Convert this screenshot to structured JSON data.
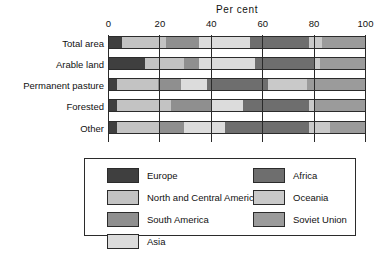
{
  "chart_data": {
    "type": "bar",
    "orientation": "horizontal",
    "stacked": true,
    "title": "Per cent",
    "xlabel": "",
    "ylabel": "",
    "xlim": [
      0,
      100
    ],
    "xticks": [
      0,
      20,
      40,
      60,
      80,
      100
    ],
    "xtick_labels": [
      "0",
      "20",
      "40",
      "60",
      "80",
      "100"
    ],
    "grid": true,
    "legend_position": "bottom",
    "categories": [
      "Total area",
      "Arable land",
      "Permanent pasture",
      "Forested",
      "Other"
    ],
    "series": [
      {
        "name": "Europe",
        "color": "#3f3f3f",
        "values": [
          5,
          14,
          3,
          3,
          3
        ]
      },
      {
        "name": "North and Central America",
        "color": "#c3c3c3",
        "values": [
          17,
          15,
          16,
          21,
          17
        ]
      },
      {
        "name": "South America",
        "color": "#8f8f8f",
        "values": [
          13,
          6,
          9,
          16,
          9
        ]
      },
      {
        "name": "Asia",
        "color": "#dcdcdc",
        "values": [
          20,
          22,
          10,
          12,
          16
        ]
      },
      {
        "name": "Africa",
        "color": "#6e6e6e",
        "values": [
          23,
          23,
          24,
          26,
          33
        ]
      },
      {
        "name": "Oceania",
        "color": "#c9c9c9",
        "values": [
          5,
          2,
          15,
          2,
          8
        ]
      },
      {
        "name": "Soviet Union",
        "color": "#9b9b9b",
        "values": [
          17,
          18,
          23,
          20,
          14
        ]
      }
    ]
  },
  "legend": {
    "left_column": [
      "Europe",
      "North and Central America",
      "South America",
      "Asia"
    ],
    "right_column": [
      "Africa",
      "Oceania",
      "Soviet Union"
    ]
  }
}
